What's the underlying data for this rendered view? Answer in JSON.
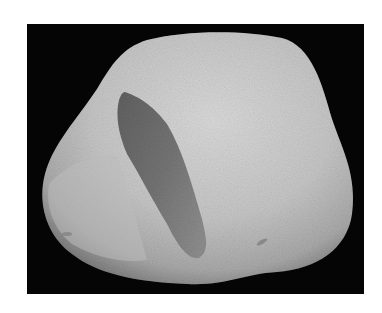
{
  "image": {
    "subject": "pebble",
    "description": "Grayscale photograph of a smooth rounded stone with a dark elongated patch on a black background",
    "colors": {
      "page_background": "#ffffff",
      "photo_background": "#050505",
      "stone_light": "#d6d6d6",
      "stone_mid": "#b9b9b9",
      "stone_shadow": "#8a8a8a",
      "patch_dark": "#5a5a5a"
    }
  }
}
